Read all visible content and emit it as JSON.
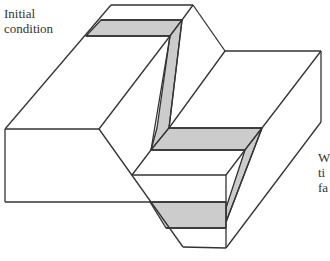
{
  "labels": {
    "initial_condition_line1": "Initial",
    "initial_condition_line2": "condition",
    "right_label_line1": "W",
    "right_label_line2": "ti",
    "right_label_line3": "fa"
  },
  "colors": {
    "stroke": "#333333",
    "band_fill": "#cccccc",
    "face_fill": "#ffffff"
  },
  "figure": {
    "type": "block diagram"
  }
}
